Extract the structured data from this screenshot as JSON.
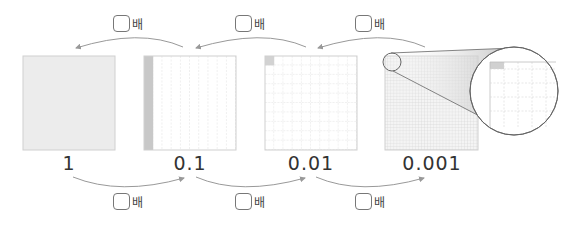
{
  "figure": {
    "values": [
      {
        "label": "1"
      },
      {
        "label": "0.1"
      },
      {
        "label": "0.01"
      },
      {
        "label": "0.001"
      }
    ],
    "top_arrows": [
      {
        "from": "0.1",
        "to": "1",
        "answer_box": "",
        "suffix": "배"
      },
      {
        "from": "0.01",
        "to": "0.1",
        "answer_box": "",
        "suffix": "배"
      },
      {
        "from": "0.001",
        "to": "0.01",
        "answer_box": "",
        "suffix": "배"
      }
    ],
    "bottom_arrows": [
      {
        "from": "1",
        "to": "0.1",
        "answer_box": "",
        "suffix": "배"
      },
      {
        "from": "0.1",
        "to": "0.01",
        "answer_box": "",
        "suffix": "배"
      },
      {
        "from": "0.01",
        "to": "0.001",
        "answer_box": "",
        "suffix": "배"
      }
    ],
    "colors": {
      "fill_light": "#ececec",
      "fill_shaded": "#c8c8c8",
      "grid_line": "#d0d0d0",
      "arrow": "#999999"
    }
  }
}
